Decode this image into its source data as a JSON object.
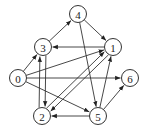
{
  "diagram": {
    "type": "directed-graph",
    "nodes": [
      {
        "id": "0",
        "label": "0",
        "x": 18,
        "y": 78
      },
      {
        "id": "1",
        "label": "1",
        "x": 113,
        "y": 47
      },
      {
        "id": "2",
        "label": "2",
        "x": 42,
        "y": 116
      },
      {
        "id": "3",
        "label": "3",
        "x": 43,
        "y": 47
      },
      {
        "id": "4",
        "label": "4",
        "x": 78,
        "y": 14
      },
      {
        "id": "5",
        "label": "5",
        "x": 98,
        "y": 116
      },
      {
        "id": "6",
        "label": "6",
        "x": 130,
        "y": 78
      }
    ],
    "edges": [
      {
        "from": "0",
        "to": "3"
      },
      {
        "from": "0",
        "to": "1"
      },
      {
        "from": "0",
        "to": "6"
      },
      {
        "from": "0",
        "to": "5"
      },
      {
        "from": "3",
        "to": "4"
      },
      {
        "from": "4",
        "to": "1"
      },
      {
        "from": "1",
        "to": "3"
      },
      {
        "from": "4",
        "to": "5"
      },
      {
        "from": "3",
        "to": "2",
        "offset": -3
      },
      {
        "from": "2",
        "to": "3",
        "offset": -3
      },
      {
        "from": "2",
        "to": "1",
        "offset": -2.5
      },
      {
        "from": "1",
        "to": "2",
        "offset": -2.5
      },
      {
        "from": "5",
        "to": "1"
      },
      {
        "from": "5",
        "to": "2"
      },
      {
        "from": "5",
        "to": "6"
      }
    ],
    "colors": {
      "stroke": "#333333",
      "fill": "#ffffff",
      "text": "#222222"
    },
    "node_radius": 8.5
  }
}
